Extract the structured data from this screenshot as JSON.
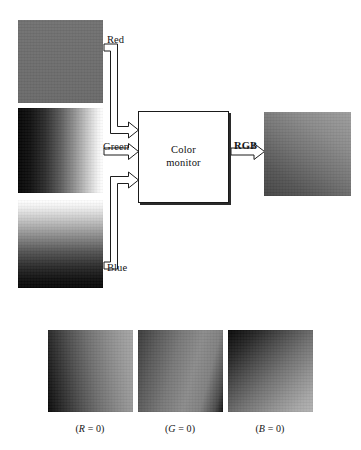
{
  "figure": {
    "width": 361,
    "height": 450,
    "background": "#ffffff"
  },
  "process_box": {
    "name": "color-monitor",
    "line1": "Color",
    "line2": "monitor",
    "x": 138,
    "y": 111,
    "w": 91,
    "h": 92,
    "fill": "#ffffff",
    "border_color": "#1a1a1a"
  },
  "input_channels": [
    {
      "key": "red",
      "label": "Red",
      "swatch_name": "red-channel-image",
      "x": 18,
      "y": 20,
      "w": 85,
      "h": 83,
      "gradient_type": "uniform",
      "gradient_css": "linear-gradient(180deg, #717171 0%, #6d6d6d 50%, #6a6a6a 100%)",
      "label_x": 107,
      "label_y": 34
    },
    {
      "key": "green",
      "label": "Green",
      "swatch_name": "green-channel-image",
      "x": 18,
      "y": 108,
      "w": 85,
      "h": 85,
      "gradient_type": "horizontal-dark-to-light",
      "gradient_css": "linear-gradient(90deg, #060606 0%, #101010 14%, #2d2d2d 32%, #5c5c5c 50%, #8f8f8f 66%, #c8c8c8 82%, #f2f2f2 94%, #ffffff 100%)",
      "label_x": 103,
      "label_y": 141
    },
    {
      "key": "blue",
      "label": "Blue",
      "swatch_name": "blue-channel-image",
      "x": 18,
      "y": 200,
      "w": 85,
      "h": 88,
      "gradient_type": "vertical-light-to-dark",
      "gradient_css": "linear-gradient(180deg, #ffffff 0%, #f0f0f0 8%, #c6c6c6 22%, #8e8e8e 40%, #565656 58%, #2a2a2a 76%, #101010 90%, #070707 100%)",
      "label_x": 107,
      "label_y": 262
    }
  ],
  "output": {
    "label": "RGB",
    "swatch_name": "rgb-composite-image",
    "x": 264,
    "y": 112,
    "w": 87,
    "h": 84,
    "gradient_type": "diagonal",
    "gradient_css": "linear-gradient(215deg, #9d9d9d 0%, #8a8a8a 28%, #6f6f6f 55%, #555555 78%, #454545 100%)",
    "label_x": 234,
    "label_y": 140
  },
  "bottom_row": [
    {
      "key": "r0",
      "caption_prefix": "(",
      "caption_var": "R",
      "caption_suffix": " = 0)",
      "caption_full": "(R = 0)",
      "swatch_name": "r-zero-image",
      "x": 48,
      "y": 330,
      "w": 85,
      "h": 82,
      "gradient_css": "linear-gradient(80deg, #0a0a0a 0%, #2b2b2b 16%, #4f4f4f 34%, #6e6e6e 52%, #878787 70%, #9a9a9a 86%, #a6a6a6 100%)",
      "caption_x": 90,
      "caption_y": 423
    },
    {
      "key": "g0",
      "caption_prefix": "(",
      "caption_var": "G",
      "caption_suffix": " = 0)",
      "caption_full": "(G = 0)",
      "swatch_name": "g-zero-image",
      "x": 138,
      "y": 330,
      "w": 85,
      "h": 82,
      "gradient_css": "linear-gradient(105deg, #3a3a3a 0%, #5a5a5a 20%, #787878 42%, #8b8b8b 62%, #808080 78%, #4a4a4a 92%, #121212 100%)",
      "caption_x": 180,
      "caption_y": 423
    },
    {
      "key": "b0",
      "caption_prefix": "(",
      "caption_var": "B",
      "caption_suffix": " = 0)",
      "caption_full": "(B = 0)",
      "swatch_name": "b-zero-image",
      "x": 228,
      "y": 330,
      "w": 85,
      "h": 82,
      "gradient_css": "linear-gradient(135deg, #080808 0%, #262626 18%, #4c4c4c 36%, #6f6f6f 54%, #8d8d8d 72%, #a6a6a6 88%, #b2b2b2 100%)",
      "caption_x": 270,
      "caption_y": 423
    }
  ],
  "arrows": [
    {
      "name": "red-channel-arrow",
      "points": "red: from right of red swatch, down, right into monitor"
    },
    {
      "name": "green-channel-arrow",
      "points": "green: straight right into monitor"
    },
    {
      "name": "blue-channel-arrow",
      "points": "blue: from right of blue swatch, up, right into monitor"
    },
    {
      "name": "rgb-output-arrow",
      "points": "rgb: straight right from monitor to composite image"
    }
  ]
}
